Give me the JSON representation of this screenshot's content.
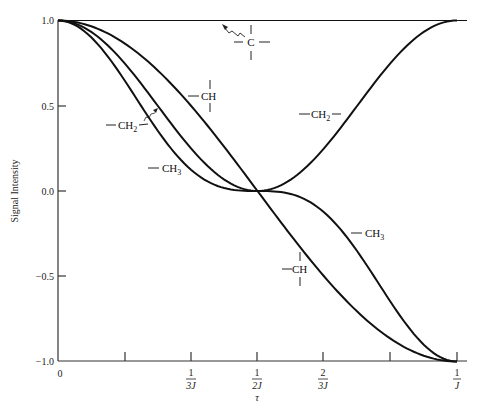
{
  "chart_data": {
    "type": "line",
    "title": "",
    "xlabel": "τ",
    "ylabel": "Signal Intensity",
    "xlim": [
      0,
      1
    ],
    "x_unit": "1/J",
    "ylim": [
      -1.0,
      1.0
    ],
    "grid": false,
    "legend": "inline labels",
    "y_ticks": [
      {
        "value": 1.0,
        "label": "1.0"
      },
      {
        "value": 0.5,
        "label": "0.5"
      },
      {
        "value": 0.0,
        "label": "0.0"
      },
      {
        "value": -0.5,
        "label": "−0.5"
      },
      {
        "value": -1.0,
        "label": "−1.0"
      }
    ],
    "x_ticks": [
      {
        "value": 0,
        "num": "0",
        "den": ""
      },
      {
        "value": 0.1667,
        "num": "",
        "den": ""
      },
      {
        "value": 0.3333,
        "num": "1",
        "den": "3J"
      },
      {
        "value": 0.5,
        "num": "1",
        "den": "2J"
      },
      {
        "value": 0.6667,
        "num": "2",
        "den": "3J"
      },
      {
        "value": 0.8333,
        "num": "",
        "den": ""
      },
      {
        "value": 1.0,
        "num": "1",
        "den": "J"
      }
    ],
    "x": [
      0,
      0.0833,
      0.1667,
      0.25,
      0.3333,
      0.4167,
      0.5,
      0.5833,
      0.6667,
      0.75,
      0.8333,
      0.9167,
      1.0
    ],
    "series": [
      {
        "name": "C (quaternary)",
        "formula": "1",
        "values": [
          1,
          1,
          1,
          1,
          1,
          1,
          1,
          1,
          1,
          1,
          1,
          1,
          1
        ]
      },
      {
        "name": "CH",
        "formula": "cos(πJτ)",
        "values": [
          1.0,
          0.966,
          0.866,
          0.707,
          0.5,
          0.259,
          0.0,
          -0.259,
          -0.5,
          -0.707,
          -0.866,
          -0.966,
          -1.0
        ]
      },
      {
        "name": "CH2",
        "formula": "cos²(πJτ)",
        "values": [
          1.0,
          0.933,
          0.75,
          0.5,
          0.25,
          0.067,
          0.0,
          0.067,
          0.25,
          0.5,
          0.75,
          0.933,
          1.0
        ]
      },
      {
        "name": "CH3",
        "formula": "cos³(πJτ)",
        "values": [
          1.0,
          0.901,
          0.65,
          0.354,
          0.125,
          0.017,
          0.0,
          -0.017,
          -0.125,
          -0.354,
          -0.65,
          -0.901,
          -1.0
        ]
      }
    ],
    "annotations": [
      {
        "text": "C",
        "target": "C (quaternary)",
        "kind": "quaternary-carbon"
      },
      {
        "text": "CH",
        "target": "CH",
        "position": "upper"
      },
      {
        "text": "CH",
        "target": "CH",
        "position": "lower"
      },
      {
        "text": "CH2",
        "target": "CH2",
        "position": "left"
      },
      {
        "text": "CH2",
        "target": "CH2",
        "position": "right"
      },
      {
        "text": "CH3",
        "target": "CH3",
        "position": "left"
      },
      {
        "text": "CH3",
        "target": "CH3",
        "position": "right"
      }
    ]
  },
  "labels": {
    "ylabel": "Signal Intensity",
    "xlabel": "τ",
    "c": "C",
    "ch": "CH",
    "ch2_base": "CH",
    "ch2_sub": "2",
    "ch3_base": "CH",
    "ch3_sub": "3",
    "x0": "0",
    "one": "1",
    "two": "2",
    "d3j": "3J",
    "d2j": "2J",
    "dj": "J",
    "y1": "1.0",
    "y05": "0.5",
    "y0": "0.0",
    "ym05": "−0.5",
    "ym1": "−1.0"
  }
}
